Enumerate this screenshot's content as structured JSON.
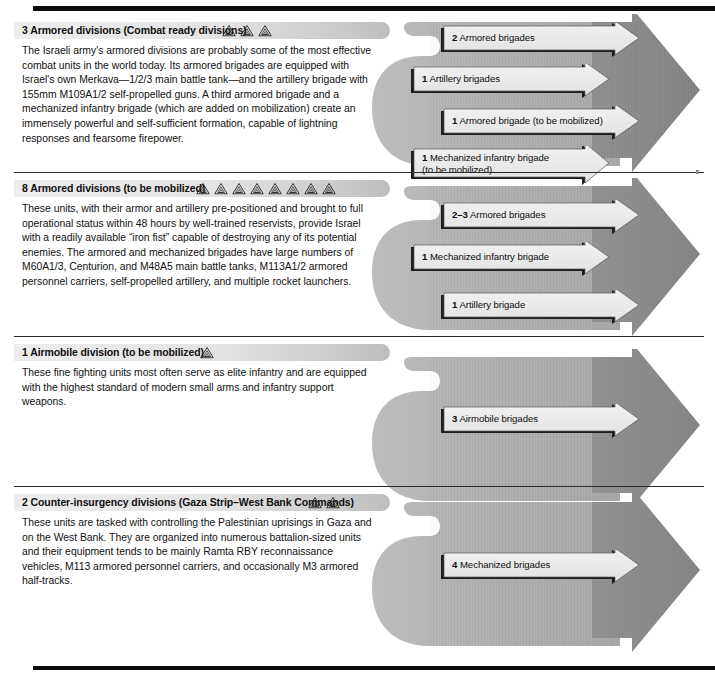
{
  "meta": {
    "doc_kind": "infographic",
    "colors": {
      "flow_light": "#b2b2b2",
      "flow_dark": "#8d8d8d",
      "arrow_fill": "#eaeaea",
      "arrow_shadow": "#1d1d1d",
      "rule": "#0b0b0b",
      "header_bar": "#e6e6e6"
    }
  },
  "sections": [
    {
      "id": "armored-combat-ready",
      "count": "3",
      "title": "3  Armored divisions (Combat ready divisions)",
      "symbol_count": 3,
      "symbol_name": "division-xx-symbol",
      "body": "The Israeli army's armored divisions are probably some of the most effective combat units in the world today. Its armored brigades are equipped with Israel's own Merkava—1/2/3 main battle tank—and the artillery brigade with 155mm M109A1/2 self-propelled guns. A third armored brigade and a mechanized infantry brigade (which are added on mobilization) create an immensely powerful and self-sufficient formation, capable of lightning responses and fearsome firepower.",
      "arrows": [
        {
          "qty": "2",
          "label": "Armored brigades"
        },
        {
          "qty": "1",
          "label": "Artillery brigades"
        },
        {
          "qty": "1",
          "label": "Armored brigade (to be mobilized)"
        },
        {
          "qty": "1",
          "label": "Mechanized infantry brigade\n(to be mobilized)"
        }
      ]
    },
    {
      "id": "armored-to-be-mobilized",
      "count": "8",
      "title": "8  Armored divisions (to be mobilized)",
      "symbol_count": 8,
      "symbol_name": "division-xx-symbol",
      "body": "These units, with their armor and artillery pre-positioned and brought to full operational status within 48 hours by well-trained reservists, provide Israel with a readily available “iron fist” capable of destroying any of its potential enemies. The armored and mechanized brigades have large numbers of M60A1/3, Centurion, and M48A5 main battle tanks, M113A1/2 armored personnel carriers, self-propelled artillery, and multiple rocket launchers.",
      "arrows": [
        {
          "qty": "2–3",
          "label": "Armored brigades"
        },
        {
          "qty": "1",
          "label": "Mechanized infantry brigade"
        },
        {
          "qty": "1",
          "label": "Artillery brigade"
        }
      ]
    },
    {
      "id": "airmobile-to-be-mobilized",
      "count": "1",
      "title": "1  Airmobile division (to be mobilized)",
      "symbol_count": 1,
      "symbol_name": "division-xx-symbol",
      "body": "These fine fighting units most often serve as elite infantry and are equipped with the highest standard of modern small arms and infantry support weapons.",
      "arrows": [
        {
          "qty": "3",
          "label": "Airmobile brigades"
        }
      ]
    },
    {
      "id": "counter-insurgency",
      "count": "2",
      "title": "2  Counter-insurgency divisions (Gaza Strip–West Bank Commands)",
      "symbol_count": 2,
      "symbol_name": "division-xx-symbol",
      "body": "These units are tasked with controlling the Palestinian uprisings in Gaza and on the West Bank. They are organized into numerous battalion-sized units and their equipment tends to be mainly Ramta RBY reconnaissance vehicles, M113 armored personnel carriers, and occasionally M3 armored half-tracks.",
      "arrows": [
        {
          "qty": "4",
          "label": "Mechanized brigades"
        }
      ]
    }
  ]
}
